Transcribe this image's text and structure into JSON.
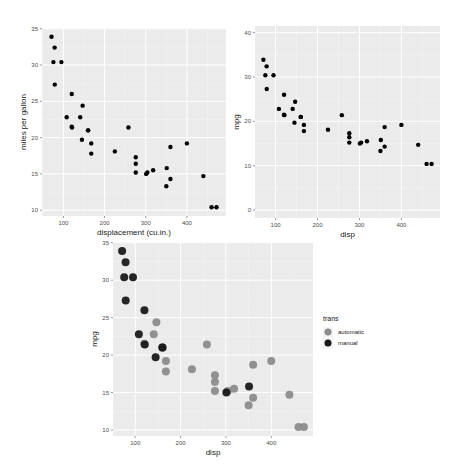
{
  "chart_data": [
    {
      "type": "scatter",
      "title": "",
      "xlabel": "displacement (cu.in.)",
      "ylabel": "miles per gallon",
      "xlim": [
        48,
        495
      ],
      "ylim": [
        9.2,
        35.1
      ],
      "xticks": [
        100,
        200,
        300,
        400
      ],
      "yticks": [
        10,
        15,
        20,
        25,
        30,
        35
      ],
      "grid": true,
      "point_size": 2.2,
      "point_color": "#000000",
      "legend": null,
      "panel": {
        "x": 42,
        "y": 28,
        "w": 184,
        "h": 188
      }
    },
    {
      "type": "scatter",
      "title": "",
      "xlabel": "disp",
      "ylabel": "mpg",
      "xlim": [
        51,
        492
      ],
      "ylim": [
        -1.8,
        41.5
      ],
      "xticks": [
        100,
        200,
        300,
        400
      ],
      "yticks": [
        0,
        10,
        20,
        30,
        40
      ],
      "grid": true,
      "point_size": 2.2,
      "point_color": "#000000",
      "legend": null,
      "panel": {
        "x": 255,
        "y": 26,
        "w": 185,
        "h": 192
      }
    },
    {
      "type": "scatter",
      "title": "",
      "xlabel": "disp",
      "ylabel": "mpg",
      "xlim": [
        51,
        492
      ],
      "ylim": [
        9.2,
        35.1
      ],
      "xticks": [
        100,
        200,
        300,
        400
      ],
      "yticks": [
        10,
        15,
        20,
        25,
        30,
        35
      ],
      "grid": true,
      "point_size": 4,
      "color_by": "trans",
      "legend": {
        "title": "trans",
        "position": "right",
        "entries": [
          {
            "label": "automatic",
            "color": "#8c8c8c"
          },
          {
            "label": "manual",
            "color": "#1a1a1a"
          }
        ]
      },
      "panel": {
        "x": 113,
        "y": 242,
        "w": 200,
        "h": 194
      }
    }
  ],
  "points": [
    {
      "disp": 160,
      "mpg": 21.0,
      "trans": "manual"
    },
    {
      "disp": 160,
      "mpg": 21.0,
      "trans": "manual"
    },
    {
      "disp": 108,
      "mpg": 22.8,
      "trans": "manual"
    },
    {
      "disp": 258,
      "mpg": 21.4,
      "trans": "automatic"
    },
    {
      "disp": 360,
      "mpg": 18.7,
      "trans": "automatic"
    },
    {
      "disp": 225,
      "mpg": 18.1,
      "trans": "automatic"
    },
    {
      "disp": 360,
      "mpg": 14.3,
      "trans": "automatic"
    },
    {
      "disp": 146.7,
      "mpg": 24.4,
      "trans": "automatic"
    },
    {
      "disp": 140.8,
      "mpg": 22.8,
      "trans": "automatic"
    },
    {
      "disp": 167.6,
      "mpg": 19.2,
      "trans": "automatic"
    },
    {
      "disp": 167.6,
      "mpg": 17.8,
      "trans": "automatic"
    },
    {
      "disp": 275.8,
      "mpg": 16.4,
      "trans": "automatic"
    },
    {
      "disp": 275.8,
      "mpg": 17.3,
      "trans": "automatic"
    },
    {
      "disp": 275.8,
      "mpg": 15.2,
      "trans": "automatic"
    },
    {
      "disp": 472,
      "mpg": 10.4,
      "trans": "automatic"
    },
    {
      "disp": 460,
      "mpg": 10.4,
      "trans": "automatic"
    },
    {
      "disp": 440,
      "mpg": 14.7,
      "trans": "automatic"
    },
    {
      "disp": 78.7,
      "mpg": 32.4,
      "trans": "manual"
    },
    {
      "disp": 75.7,
      "mpg": 30.4,
      "trans": "manual"
    },
    {
      "disp": 71.1,
      "mpg": 33.9,
      "trans": "manual"
    },
    {
      "disp": 120.1,
      "mpg": 21.5,
      "trans": "automatic"
    },
    {
      "disp": 318,
      "mpg": 15.5,
      "trans": "automatic"
    },
    {
      "disp": 304,
      "mpg": 15.2,
      "trans": "automatic"
    },
    {
      "disp": 350,
      "mpg": 13.3,
      "trans": "automatic"
    },
    {
      "disp": 400,
      "mpg": 19.2,
      "trans": "automatic"
    },
    {
      "disp": 79,
      "mpg": 27.3,
      "trans": "manual"
    },
    {
      "disp": 120.3,
      "mpg": 26.0,
      "trans": "manual"
    },
    {
      "disp": 95.1,
      "mpg": 30.4,
      "trans": "manual"
    },
    {
      "disp": 351,
      "mpg": 15.8,
      "trans": "manual"
    },
    {
      "disp": 145,
      "mpg": 19.7,
      "trans": "manual"
    },
    {
      "disp": 301,
      "mpg": 15.0,
      "trans": "manual"
    },
    {
      "disp": 121,
      "mpg": 21.4,
      "trans": "manual"
    }
  ],
  "colors": {
    "panel_bg": "#ebebeb",
    "grid_major": "#ffffff",
    "grid_minor": "#f4f4f4",
    "tick_text": "#4d4d4d",
    "automatic": "#8c8c8c",
    "manual": "#1a1a1a"
  }
}
